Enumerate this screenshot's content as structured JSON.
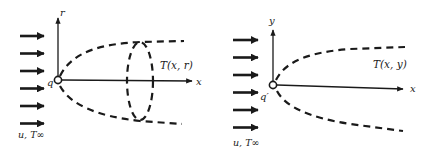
{
  "diagram": {
    "panels": [
      {
        "name": "axisymmetric",
        "axis_labels": {
          "horizontal": "x",
          "vertical": "r"
        },
        "source_label": "q",
        "field_label": "T(x, r)",
        "inflow_label": "u, T∞",
        "inflow_arrow_count": 6,
        "has_cross_section_ellipse": true
      },
      {
        "name": "planar",
        "axis_labels": {
          "horizontal": "x",
          "vertical": "y"
        },
        "source_label": "q′",
        "field_label": "T(x, y)",
        "inflow_label": "u, T∞",
        "inflow_arrow_count": 6,
        "has_cross_section_ellipse": false
      }
    ],
    "colors": {
      "ink": "#1a1a1a",
      "background": "#ffffff"
    }
  }
}
